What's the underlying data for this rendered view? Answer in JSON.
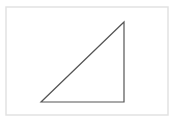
{
  "diagram": {
    "type": "geometric-shape",
    "shape": "right-triangle",
    "frame": {
      "x": 6,
      "y": 7,
      "width": 162,
      "height": 108,
      "stroke": "#e2e2e2",
      "fill": "#ffffff"
    },
    "triangle": {
      "points": "41,102 124,102 124,22",
      "stroke": "#555555",
      "stroke_width": 1.2,
      "fill": "none"
    }
  }
}
